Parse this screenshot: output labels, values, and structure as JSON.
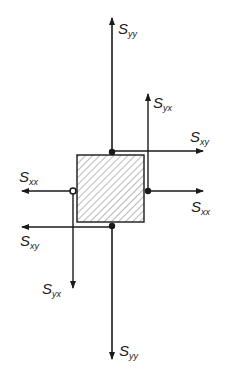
{
  "diagram": {
    "type": "stress-element",
    "element": {
      "x": 77,
      "y": 155,
      "width": 67,
      "height": 67,
      "fill": "hatched"
    },
    "labels": {
      "syy_top": {
        "main": "S",
        "sub": "yy"
      },
      "syx_top": {
        "main": "S",
        "sub": "yx"
      },
      "sxy_right": {
        "main": "S",
        "sub": "xy"
      },
      "sxx_left": {
        "main": "S",
        "sub": "xx"
      },
      "sxx_right": {
        "main": "S",
        "sub": "xx"
      },
      "sxy_left": {
        "main": "S",
        "sub": "xy"
      },
      "syx_bottom": {
        "main": "S",
        "sub": "yx"
      },
      "syy_bottom": {
        "main": "S",
        "sub": "yy"
      }
    },
    "colors": {
      "line": "#1a1a1a",
      "hatch": "#666666",
      "background": "#ffffff"
    }
  }
}
